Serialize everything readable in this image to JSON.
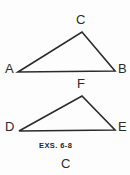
{
  "figure": {
    "panel_letter": "C",
    "caption": "EXS. 6-8",
    "stroke_color": "#2b2b2b",
    "background_color": "#fdfdfd",
    "stroke_width": 1.6
  },
  "shapes": [
    {
      "name": "triangle-abc",
      "type": "triangle",
      "vertices": [
        {
          "label": "A",
          "x": 18,
          "y": 72
        },
        {
          "label": "C",
          "x": 82,
          "y": 32
        },
        {
          "label": "B",
          "x": 115,
          "y": 71
        }
      ],
      "points_attr": "18,72 82,32 115,71"
    },
    {
      "name": "triangle-def",
      "type": "triangle",
      "vertices": [
        {
          "label": "D",
          "x": 19,
          "y": 131
        },
        {
          "label": "F",
          "x": 82,
          "y": 96
        },
        {
          "label": "E",
          "x": 115,
          "y": 130
        }
      ],
      "points_attr": "19,131 82,96 115,130"
    }
  ],
  "labels": {
    "a": "A",
    "b": "B",
    "c": "C",
    "d": "D",
    "e": "E",
    "f": "F"
  }
}
